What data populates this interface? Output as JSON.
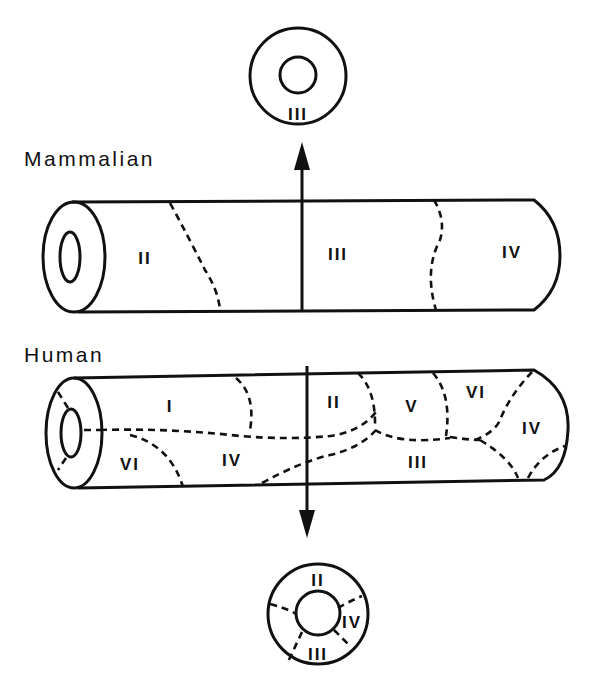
{
  "diagram": {
    "labels": {
      "mammalian": "Mammalian",
      "human": "Human"
    },
    "top_cross_section": {
      "regions": [
        "III"
      ]
    },
    "mammalian_tube": {
      "regions": [
        "II",
        "III",
        "IV"
      ]
    },
    "human_tube": {
      "regions": [
        "I",
        "VI",
        "IV",
        "II",
        "V",
        "VI",
        "III",
        "IV"
      ]
    },
    "bottom_cross_section": {
      "regions": [
        "II",
        "IV",
        "III"
      ]
    },
    "colors": {
      "ink": "#111111",
      "background": "#ffffff"
    }
  }
}
